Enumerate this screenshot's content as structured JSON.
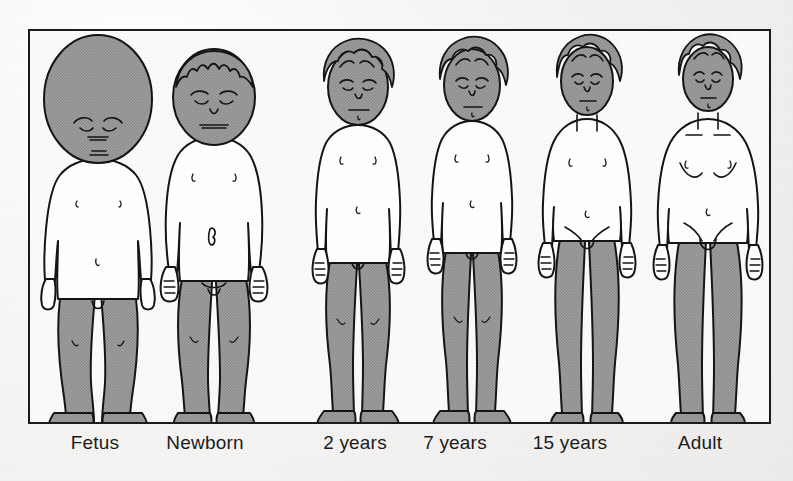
{
  "figure": {
    "frame": {
      "x": 28,
      "y": 29,
      "width": 743,
      "height": 395,
      "border_color": "#1a1a1a"
    },
    "colors": {
      "page_background": "#f6f5f3",
      "panel_background": "#fbfaf9",
      "outline": "#1a1a1a",
      "shaded_region": "#9a9a9a",
      "skin_unshaded": "#ffffff",
      "label_text": "#1b1b1b"
    },
    "shading_legend": "Shaded areas indicate the head and the lower limbs",
    "baseline_y": 422,
    "stages": [
      {
        "label": "Fetus",
        "label_x": 95,
        "center_x": 96,
        "head_top_y": 32,
        "head_width": 108,
        "head_height": 128,
        "shoulder_y": 170,
        "crotch_y": 300,
        "feet_y": 422,
        "total_height_px": 390,
        "head_fraction": "about 1/2 of body length",
        "shaded_parts": [
          "head",
          "legs"
        ],
        "hair": "none",
        "eyes": "closed",
        "posture": "bowed legs, arms at sides"
      },
      {
        "label": "Newborn",
        "label_x": 205,
        "center_x": 212,
        "head_top_y": 36,
        "head_width": 82,
        "head_height": 100,
        "shoulder_y": 144,
        "crotch_y": 278,
        "feet_y": 422,
        "total_height_px": 386,
        "head_fraction": "about 1/4 of body length",
        "shaded_parts": [
          "head",
          "legs"
        ],
        "hair": "short spiky",
        "eyes": "closed",
        "posture": "stocky, arms at sides"
      },
      {
        "label": "2 years",
        "label_x": 355,
        "center_x": 356,
        "head_top_y": 32,
        "head_width": 72,
        "head_height": 88,
        "shoulder_y": 132,
        "crotch_y": 258,
        "feet_y": 422,
        "total_height_px": 390,
        "head_fraction": "about 1/5 of body length",
        "shaded_parts": [
          "head",
          "legs"
        ],
        "hair": "curly",
        "eyes": "open",
        "posture": "standing, arms at sides"
      },
      {
        "label": "7 years",
        "label_x": 455,
        "center_x": 470,
        "head_top_y": 32,
        "head_width": 68,
        "head_height": 84,
        "shoulder_y": 128,
        "crotch_y": 248,
        "feet_y": 422,
        "total_height_px": 390,
        "head_fraction": "about 1/6 of body length",
        "shaded_parts": [
          "head",
          "legs"
        ],
        "hair": "curly",
        "eyes": "open",
        "posture": "standing, arms at sides"
      },
      {
        "label": "15 years",
        "label_x": 570,
        "center_x": 585,
        "head_top_y": 34,
        "head_width": 62,
        "head_height": 78,
        "shoulder_y": 126,
        "crotch_y": 238,
        "feet_y": 422,
        "total_height_px": 388,
        "head_fraction": "about 1/7 of body length",
        "shaded_parts": [
          "head",
          "legs"
        ],
        "hair": "curly",
        "eyes": "open",
        "posture": "standing, arms at sides"
      },
      {
        "label": "Adult",
        "label_x": 700,
        "center_x": 706,
        "head_top_y": 36,
        "head_width": 58,
        "head_height": 74,
        "shoulder_y": 124,
        "crotch_y": 236,
        "feet_y": 422,
        "total_height_px": 386,
        "head_fraction": "about 1/8 of body length",
        "shaded_parts": [
          "head",
          "legs"
        ],
        "hair": "curly",
        "eyes": "open",
        "posture": "standing, arms at sides"
      }
    ]
  }
}
